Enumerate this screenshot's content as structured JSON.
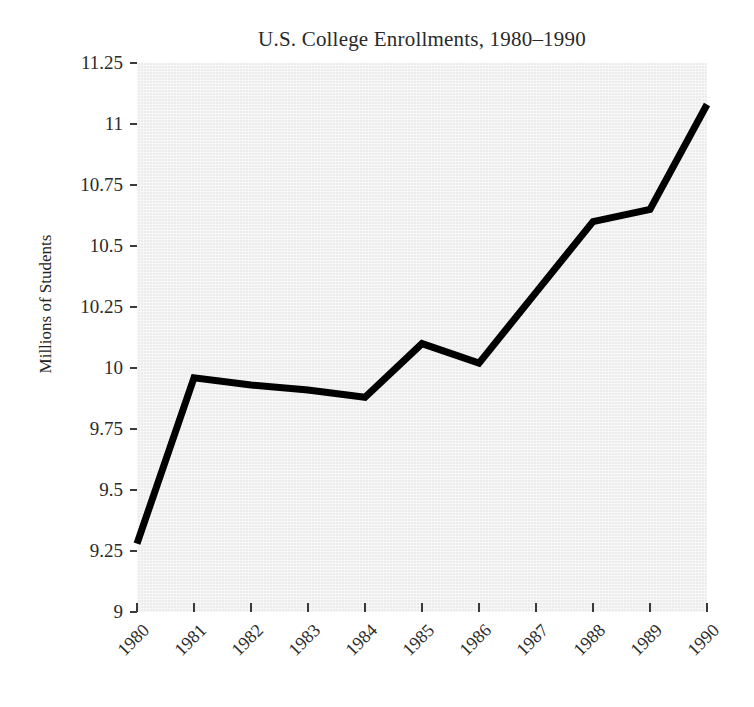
{
  "chart_data": {
    "type": "line",
    "title": "U.S. College Enrollments, 1980–1990",
    "xlabel": "",
    "ylabel": "Millions of Students",
    "categories": [
      "1980",
      "1981",
      "1982",
      "1983",
      "1984",
      "1985",
      "1986",
      "1987",
      "1988",
      "1989",
      "1990"
    ],
    "x": [
      1980,
      1981,
      1982,
      1983,
      1984,
      1985,
      1986,
      1987,
      1988,
      1989,
      1990
    ],
    "values": [
      9.28,
      9.96,
      9.93,
      9.91,
      9.88,
      10.1,
      10.02,
      10.31,
      10.6,
      10.65,
      11.08
    ],
    "series": [
      {
        "name": "Enrollment",
        "values": [
          9.28,
          9.96,
          9.93,
          9.91,
          9.88,
          10.1,
          10.02,
          10.31,
          10.6,
          10.65,
          11.08
        ]
      }
    ],
    "ylim": [
      9,
      11.25
    ],
    "xlim": [
      1980,
      1990
    ],
    "ytick_labels": [
      "9",
      "9.25",
      "9.5",
      "9.75",
      "10",
      "10.25",
      "10.5",
      "10.75",
      "11",
      "11.25"
    ],
    "ytick_values": [
      9,
      9.25,
      9.5,
      9.75,
      10,
      10.25,
      10.5,
      10.75,
      11,
      11.25
    ],
    "xtick_labels": [
      "1980",
      "1981",
      "1982",
      "1983",
      "1984",
      "1985",
      "1986",
      "1987",
      "1988",
      "1989",
      "1990"
    ],
    "grid": false,
    "legend": null,
    "line_color": "#000000",
    "line_width": 7,
    "plot_background": "#ececec",
    "figure_background": "#ffffff",
    "text_color": "#2b2b2b",
    "xtick_label_rotation": -45
  }
}
